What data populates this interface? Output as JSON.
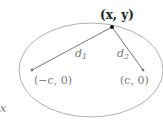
{
  "diagram": {
    "point_label": "(x, y)",
    "focus_left_label": "(−c, 0)",
    "focus_right_label": "(c, 0)",
    "distance_1_label": "d",
    "distance_1_sub": "1",
    "distance_2_label": "d",
    "distance_2_sub": "2",
    "axis_fragment": "x",
    "colors": {
      "ellipse": "#9a9a9a",
      "line": "#777777",
      "point": "#111111",
      "label": "#7a7a7a"
    }
  }
}
